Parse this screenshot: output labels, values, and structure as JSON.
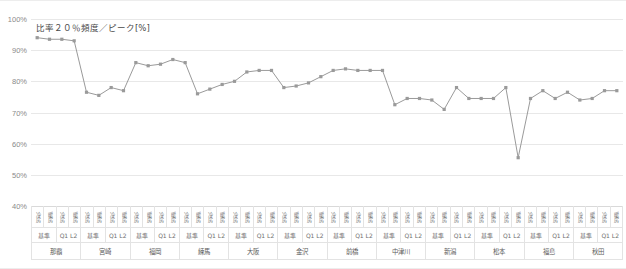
{
  "chart_data": {
    "type": "line",
    "title": "比率２０％頻度／ピーク[%]",
    "xlabel": "",
    "ylabel": "",
    "ylim": [
      40,
      100
    ],
    "ytick_labels": [
      "100%",
      "90%",
      "80%",
      "70%",
      "60%",
      "50%",
      "40%"
    ],
    "ytick_values": [
      100,
      90,
      80,
      70,
      60,
      50,
      40
    ],
    "grid": true,
    "legend": "none",
    "series_color": "#9a9a9a",
    "marker": "square",
    "cities": [
      "那覇",
      "宮崎",
      "福岡",
      "練馬",
      "大阪",
      "金沢",
      "前橋",
      "中津川",
      "新潟",
      "松本",
      "福島",
      "秋田"
    ],
    "conditions": [
      "基準",
      "Q1 L2"
    ],
    "modes": [
      "冷房",
      "暖房"
    ],
    "categories": [
      "那覇 基準 冷房",
      "那覇 基準 暖房",
      "那覇 Q1 L2 冷房",
      "那覇 Q1 L2 暖房",
      "宮崎 基準 冷房",
      "宮崎 基準 暖房",
      "宮崎 Q1 L2 冷房",
      "宮崎 Q1 L2 暖房",
      "福岡 基準 冷房",
      "福岡 基準 暖房",
      "福岡 Q1 L2 冷房",
      "福岡 Q1 L2 暖房",
      "練馬 基準 冷房",
      "練馬 基準 暖房",
      "練馬 Q1 L2 冷房",
      "練馬 Q1 L2 暖房",
      "大阪 基準 冷房",
      "大阪 基準 暖房",
      "大阪 Q1 L2 冷房",
      "大阪 Q1 L2 暖房",
      "金沢 基準 冷房",
      "金沢 基準 暖房",
      "金沢 Q1 L2 冷房",
      "金沢 Q1 L2 暖房",
      "前橋 基準 冷房",
      "前橋 基準 暖房",
      "前橋 Q1 L2 冷房",
      "前橋 Q1 L2 暖房",
      "中津川 基準 冷房",
      "中津川 基準 暖房",
      "中津川 Q1 L2 冷房",
      "中津川 Q1 L2 暖房",
      "新潟 基準 冷房",
      "新潟 基準 暖房",
      "新潟 Q1 L2 冷房",
      "新潟 Q1 L2 暖房",
      "松本 基準 冷房",
      "松本 基準 暖房",
      "松本 Q1 L2 冷房",
      "松本 Q1 L2 暖房",
      "福島 基準 冷房",
      "福島 基準 暖房",
      "福島 Q1 L2 冷房",
      "福島 Q1 L2 暖房",
      "秋田 基準 冷房",
      "秋田 基準 暖房",
      "秋田 Q1 L2 冷房",
      "秋田 Q1 L2 暖房"
    ],
    "values": [
      94.0,
      93.5,
      93.5,
      93.0,
      76.5,
      75.5,
      78.0,
      77.0,
      86.0,
      85.0,
      85.5,
      87.0,
      86.0,
      76.0,
      77.5,
      79.0,
      80.0,
      83.0,
      83.5,
      83.5,
      78.0,
      78.5,
      79.5,
      81.5,
      83.5,
      84.0,
      83.5,
      83.5,
      83.5,
      72.5,
      74.5,
      74.5,
      74.0,
      71.0,
      78.0,
      74.5,
      74.5,
      74.5,
      78.0,
      55.5,
      74.5,
      77.0,
      74.5,
      76.5,
      74.0,
      74.5,
      77.0,
      77.0
    ]
  }
}
